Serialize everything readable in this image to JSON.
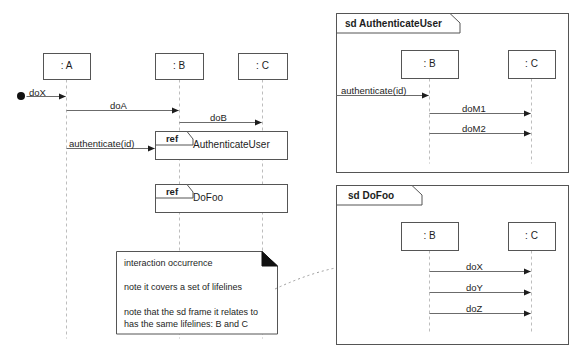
{
  "diagram": {
    "kind": "uml-sequence-diagram",
    "background_color": "#ffffff",
    "line_color": "#555555",
    "lifeline_color": "#bdbdbd",
    "text_color": "#1d1d1d"
  },
  "main_diagram": {
    "lifelines": [
      {
        "id": "A",
        "label": ": A",
        "x": 66,
        "box": {
          "x": 43,
          "y": 53,
          "w": 47,
          "h": 26
        }
      },
      {
        "id": "B",
        "label": ": B",
        "x": 179,
        "box": {
          "x": 155,
          "y": 53,
          "w": 48,
          "h": 26
        }
      },
      {
        "id": "C",
        "label": ": C",
        "x": 262,
        "box": {
          "x": 238,
          "y": 53,
          "w": 49,
          "h": 26
        }
      }
    ],
    "found_message_origin": {
      "label": "start-dot",
      "x": 21,
      "y": 96
    },
    "messages": [
      {
        "label": "doX",
        "from": "origin",
        "to": "A",
        "y": 96,
        "x1": 26,
        "x2": 66,
        "label_x": 29,
        "label_y": 87
      },
      {
        "label": "doA",
        "from": "A",
        "to": "B",
        "y": 110,
        "x1": 66,
        "x2": 179,
        "label_x": 110,
        "label_y": 100
      },
      {
        "label": "doB",
        "from": "B",
        "to": "C",
        "y": 122,
        "x1": 179,
        "x2": 262,
        "label_x": 210,
        "label_y": 112
      },
      {
        "label": "authenticate(id)",
        "from": "A",
        "to": "B",
        "y": 148,
        "x1": 66,
        "x2": 155,
        "label_x": 69,
        "label_y": 138
      }
    ],
    "interaction_uses": [
      {
        "keyword": "ref",
        "name": "AuthenticateUser",
        "box": {
          "x": 155,
          "y": 131,
          "w": 132,
          "h": 28
        },
        "name_x": 193,
        "name_y": 139
      },
      {
        "keyword": "ref",
        "name": "DoFoo",
        "box": {
          "x": 155,
          "y": 184,
          "w": 132,
          "h": 28
        },
        "name_x": 193,
        "name_y": 192
      }
    ]
  },
  "note": {
    "box": {
      "x": 116,
      "y": 251,
      "w": 161,
      "h": 83
    },
    "fold_size": 15,
    "lines": [
      "interaction occurrence",
      "",
      "note it covers a set of lifelines",
      "",
      "note that the sd frame it relates to",
      "has the same lifelines: B and C"
    ],
    "anchor_endpoint": {
      "x": 340,
      "y": 267
    }
  },
  "frames": [
    {
      "id": "frame-authenticateuser",
      "title": "sd AuthenticateUser",
      "box": {
        "x": 336,
        "y": 13,
        "w": 232,
        "h": 159
      },
      "tab": {
        "w": 114,
        "h": 20,
        "notch": 10
      },
      "title_x": 345,
      "title_y": 18,
      "lifelines": [
        {
          "id": "B",
          "label": ": B",
          "x": 429,
          "box": {
            "x": 401,
            "y": 50,
            "w": 57,
            "h": 28
          }
        },
        {
          "id": "C",
          "label": ": C",
          "x": 531,
          "box": {
            "x": 508,
            "y": 50,
            "w": 47,
            "h": 28
          }
        }
      ],
      "inbound_message": {
        "label": "authenticate(id)",
        "y": 95,
        "x1": 336,
        "x2": 429,
        "label_x": 341,
        "label_y": 85
      },
      "messages": [
        {
          "label": "doM1",
          "from": "B",
          "to": "C",
          "y": 113,
          "x1": 429,
          "x2": 531,
          "label_x": 462,
          "label_y": 103
        },
        {
          "label": "doM2",
          "from": "B",
          "to": "C",
          "y": 133,
          "x1": 429,
          "x2": 531,
          "label_x": 462,
          "label_y": 123
        }
      ],
      "lifeline_bottom": 163
    },
    {
      "id": "frame-dofoo",
      "title": "sd DoFoo",
      "box": {
        "x": 336,
        "y": 185,
        "w": 232,
        "h": 159
      },
      "tab": {
        "w": 76,
        "h": 20,
        "notch": 10
      },
      "title_x": 348,
      "title_y": 190,
      "lifelines": [
        {
          "id": "B",
          "label": ": B",
          "x": 429,
          "box": {
            "x": 401,
            "y": 222,
            "w": 57,
            "h": 28
          }
        },
        {
          "id": "C",
          "label": ": C",
          "x": 531,
          "box": {
            "x": 508,
            "y": 222,
            "w": 47,
            "h": 28
          }
        }
      ],
      "inbound_message": null,
      "messages": [
        {
          "label": "doX",
          "from": "B",
          "to": "C",
          "y": 271,
          "x1": 429,
          "x2": 531,
          "label_x": 466,
          "label_y": 261
        },
        {
          "label": "doY",
          "from": "B",
          "to": "C",
          "y": 292,
          "x1": 429,
          "x2": 531,
          "label_x": 466,
          "label_y": 282
        },
        {
          "label": "doZ",
          "from": "B",
          "to": "C",
          "y": 313,
          "x1": 429,
          "x2": 531,
          "label_x": 466,
          "label_y": 303
        }
      ],
      "lifeline_bottom": 334
    }
  ]
}
